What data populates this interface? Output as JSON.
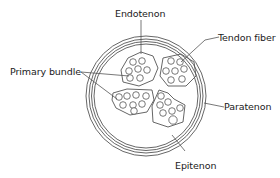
{
  "diagram": {
    "labels": {
      "endotenon": "Endotenon",
      "tendon_fiber": "Tendon fiber",
      "primary_bundle": "Primary bundle",
      "paratenon": "Paratenon",
      "epitenon": "Epitenon"
    },
    "components": [
      {
        "id": "paratenon",
        "shape": "outer concentric rings",
        "count": 3
      },
      {
        "id": "epitenon",
        "shape": "inner ring surrounding bundles"
      },
      {
        "id": "primary_bundle",
        "shape": "polygon containing fibers",
        "count": 4
      },
      {
        "id": "tendon_fiber",
        "shape": "small circles inside bundles"
      },
      {
        "id": "endotenon",
        "shape": "septa between bundles"
      }
    ],
    "colors": {
      "stroke": "#555555",
      "text": "#1a1a1a",
      "background": "#ffffff"
    }
  }
}
